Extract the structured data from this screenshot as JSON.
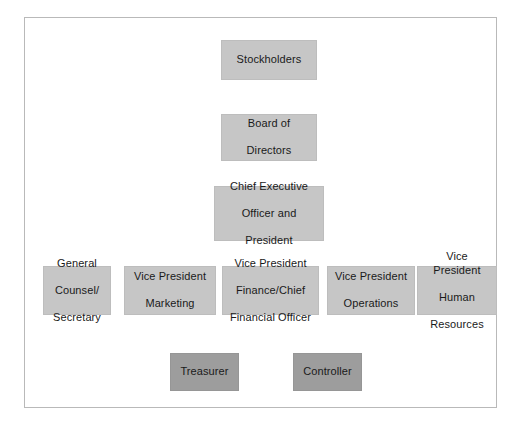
{
  "diagram": {
    "type": "org-chart",
    "frame": {
      "border_color": "#b9b9b9",
      "background": "#ffffff"
    },
    "colors": {
      "node_fill_light": "#c6c6c6",
      "node_fill_dark": "#9d9d9d",
      "connector": "#8c8c8c",
      "text": "#1a1a1a"
    },
    "nodes": {
      "stockholders": {
        "label": "Stockholders",
        "level": 1,
        "style": "light"
      },
      "board": {
        "label": "Board of\nDirectors",
        "line1": "Board of",
        "line2": "Directors",
        "level": 2,
        "style": "light"
      },
      "ceo": {
        "line1": "Chief Executive",
        "line2": "Officer and",
        "line3": "President",
        "level": 3,
        "style": "light"
      },
      "general_counsel": {
        "line1": "General",
        "line2": "Counsel/",
        "line3": "Secretary",
        "level": 4,
        "style": "light"
      },
      "vp_marketing": {
        "line1": "Vice President",
        "line2": "Marketing",
        "level": 4,
        "style": "light"
      },
      "vp_finance": {
        "line1": "Vice President",
        "line2": "Finance/Chief",
        "line3": "Financial Officer",
        "level": 4,
        "style": "light"
      },
      "vp_operations": {
        "line1": "Vice President",
        "line2": "Operations",
        "level": 4,
        "style": "light"
      },
      "vp_hr": {
        "line1": "Vice President",
        "line2": "Human",
        "line3": "Resources",
        "level": 4,
        "style": "light"
      },
      "treasurer": {
        "label": "Treasurer",
        "level": 5,
        "style": "dark"
      },
      "controller": {
        "label": "Controller",
        "level": 5,
        "style": "dark"
      }
    }
  }
}
